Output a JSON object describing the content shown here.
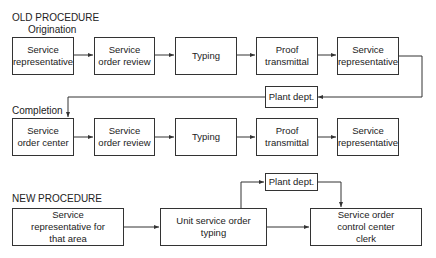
{
  "old_procedure": {
    "title": "OLD PROCEDURE",
    "origination": {
      "label": "Origination",
      "steps": [
        "Service representative",
        "Service order review",
        "Typing",
        "Proof transmittal",
        "Service representative"
      ]
    },
    "plant_dept": "Plant dept.",
    "completion": {
      "label": "Completion",
      "steps": [
        "Service order center",
        "Service order review",
        "Typing",
        "Proof transmittal",
        "Service representative"
      ]
    }
  },
  "new_procedure": {
    "title": "NEW PROCEDURE",
    "steps": [
      "Service representative for that area",
      "Unit service order typing",
      "Service order control center clerk"
    ],
    "plant_dept": "Plant dept."
  },
  "colors": {
    "line": "#333333",
    "text": "#222222",
    "background": "#ffffff"
  }
}
